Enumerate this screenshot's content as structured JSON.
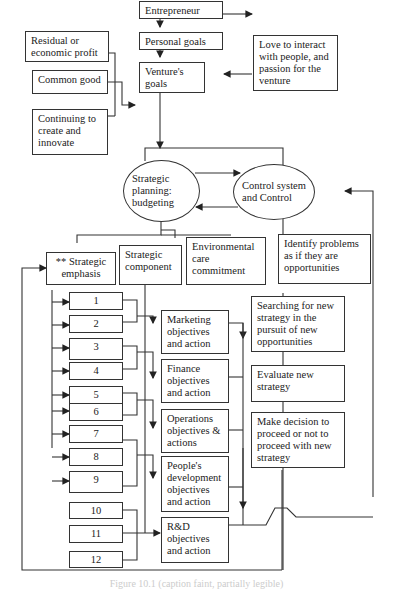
{
  "top": {
    "residual": "Residual or economic profit",
    "common_good": "Common good",
    "continuing": "Continuing to create and innovate",
    "entrepreneur": "Entrepreneur",
    "personal_goals": "Personal goals",
    "ventures_goals": "Venture's goals",
    "love": "Love to interact with people, and passion for the venture"
  },
  "middle": {
    "strategic_planning": "Strategic planning: budgeting",
    "control_system": "Control system and Control",
    "strategic_emphasis": "** Strategic emphasis",
    "strategic_component": "Strategic component",
    "environmental": "Environmental care commitment",
    "identify_problems": "Identify problems as if they are opportunities"
  },
  "numbers": [
    "1",
    "2",
    "3",
    "4",
    "5",
    "6",
    "7",
    "8",
    "9",
    "10",
    "11",
    "12"
  ],
  "objectives": {
    "marketing": "Marketing objectives and action",
    "finance": "Finance objectives and action",
    "operations": "Operations objectives & actions",
    "people": "People's development objectives and action",
    "rnd": "R&D objectives and action"
  },
  "strategy": {
    "searching": "Searching for new strategy in the pursuit of new opportunities",
    "evaluate": "Evaluate new strategy",
    "decision": "Make decision to proceed or not to proceed with new strategy"
  },
  "caption": "Figure 10.1 (caption faint, partially legible)"
}
